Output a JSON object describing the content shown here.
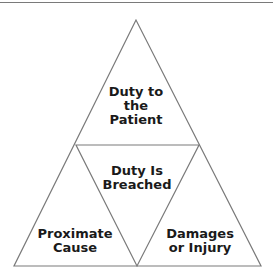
{
  "diagram": {
    "type": "triangle-of-triangles",
    "line_color": "#7a7a7a",
    "text_color": "#1a1a1a",
    "sections": [
      {
        "id": "top",
        "label_lines": [
          "Duty to",
          "the",
          "Patient"
        ]
      },
      {
        "id": "center",
        "label_lines": [
          "Duty Is",
          "Breached"
        ]
      },
      {
        "id": "bottom-left",
        "label_lines": [
          "Proximate",
          "Cause"
        ]
      },
      {
        "id": "bottom-right",
        "label_lines": [
          "Damages",
          "or Injury"
        ]
      }
    ]
  }
}
